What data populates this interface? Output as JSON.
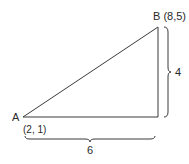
{
  "diagram": {
    "type": "right-triangle",
    "points": {
      "A": {
        "label": "A",
        "coords": "(2, 1)"
      },
      "B": {
        "label": "B (8,5)"
      }
    },
    "dimensions": {
      "horizontal": "6",
      "vertical": "4"
    },
    "colors": {
      "line": "#3a3a3a",
      "text": "#2a2a2a",
      "background": "#ffffff"
    }
  }
}
